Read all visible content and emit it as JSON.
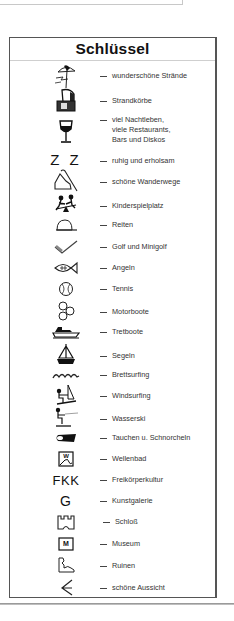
{
  "legend": {
    "title": "Schlüssel",
    "items": [
      {
        "icon": "beach-umbrella-icon",
        "label": "wunderschöne Strände"
      },
      {
        "icon": "beach-chair-icon",
        "label": "Strandkörbe"
      },
      {
        "icon": "wine-glass-icon",
        "label": "viel Nachtleben,",
        "label2": "viele Restaurants,",
        "label3": "Bars und Diskos"
      },
      {
        "icon": "zz-sleep-icon",
        "icon_text": "Z Z",
        "label": "ruhig und erholsam"
      },
      {
        "icon": "hiking-boot-icon",
        "label": "schöne Wanderwege"
      },
      {
        "icon": "playground-seesaw-icon",
        "label": "Kinderspielplatz"
      },
      {
        "icon": "riding-cap-icon",
        "label": "Reiten"
      },
      {
        "icon": "golf-club-icon",
        "label": "Golf und Minigolf"
      },
      {
        "icon": "fish-icon",
        "label": "Angeln"
      },
      {
        "icon": "tennis-ball-icon",
        "label": "Tennis"
      },
      {
        "icon": "propeller-icon",
        "label": "Motorboote"
      },
      {
        "icon": "pedal-boat-icon",
        "label": "Tretboote"
      },
      {
        "icon": "sailboat-icon",
        "label": "Segeln"
      },
      {
        "icon": "waves-icon",
        "label": "Brettsurfing"
      },
      {
        "icon": "windsurfer-icon",
        "label": "Windsurfing"
      },
      {
        "icon": "water-skier-icon",
        "label": "Wasserski"
      },
      {
        "icon": "flipper-icon",
        "label": "Tauchen u. Schnorcheln"
      },
      {
        "icon": "wave-pool-icon",
        "icon_text": "W",
        "label": "Wellenbad"
      },
      {
        "icon": "fkk-icon",
        "icon_text": "FKK",
        "label": "Freikörperkultur"
      },
      {
        "icon": "gallery-g-icon",
        "icon_text": "G",
        "label": "Kunstgalerie"
      },
      {
        "icon": "castle-icon",
        "label": "Schloß"
      },
      {
        "icon": "museum-icon",
        "icon_text": "M",
        "label": "Museum"
      },
      {
        "icon": "ruins-icon",
        "label": "Ruinen"
      },
      {
        "icon": "viewpoint-icon",
        "label": "schöne Aussicht"
      }
    ]
  }
}
